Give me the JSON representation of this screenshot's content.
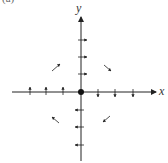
{
  "caption": "(a)",
  "axes": {
    "x_label": "x",
    "y_label": "y"
  },
  "origin": {
    "marker": "filled-dot",
    "color": "#111111"
  },
  "colors": {
    "ink": "#222222",
    "background": "#ffffff"
  },
  "vector_field": {
    "x_axis_negative": {
      "count": 3,
      "direction": "up"
    },
    "x_axis_positive": {
      "count": 3,
      "direction": "down"
    },
    "y_axis_positive": {
      "count": 3,
      "direction": "right"
    },
    "y_axis_negative": {
      "count": 3,
      "direction": "left"
    },
    "quadrant_II": {
      "direction": "up-right"
    },
    "quadrant_I": {
      "direction": "down-right"
    },
    "quadrant_III": {
      "direction": "up-left"
    },
    "quadrant_IV": {
      "direction": "down-left"
    }
  }
}
